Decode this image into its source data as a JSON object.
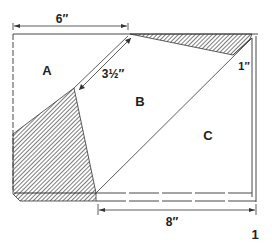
{
  "diagram": {
    "regions": [
      {
        "id": "A",
        "label": "A"
      },
      {
        "id": "B",
        "label": "B"
      },
      {
        "id": "C",
        "label": "C"
      }
    ],
    "dimensions": {
      "top_width": "6″",
      "diagonal": "3½″",
      "corner": "1″",
      "bottom_width": "8″"
    },
    "figure_number": "1",
    "colors": {
      "line": "#333333",
      "hatch": "#444444",
      "background": "#ffffff"
    }
  }
}
